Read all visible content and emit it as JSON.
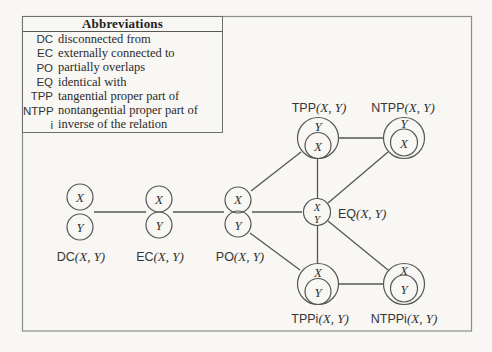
{
  "figure": {
    "background_color": "#f8f7f4",
    "stroke_color": "#565656",
    "frame_color": "#8d8d8d",
    "text_color": "#2f2f2f"
  },
  "abbreviations": {
    "title": "Abbreviations",
    "rows": [
      {
        "abbr": "DC",
        "meaning": "disconnected from"
      },
      {
        "abbr": "EC",
        "meaning": "externally connected to"
      },
      {
        "abbr": "PO",
        "meaning": "partially overlaps"
      },
      {
        "abbr": "EQ",
        "meaning": "identical with"
      },
      {
        "abbr": "TPP",
        "meaning": "tangential proper part of"
      },
      {
        "abbr": "NTPP",
        "meaning": "nontangential proper part of"
      },
      {
        "abbr": "i",
        "meaning": "inverse of the relation"
      }
    ]
  },
  "nodes": {
    "dc": {
      "rel": "DC",
      "args": "(X, Y)",
      "top": "X",
      "bottom": "Y"
    },
    "ec": {
      "rel": "EC",
      "args": "(X, Y)",
      "top": "X",
      "bottom": "Y"
    },
    "po": {
      "rel": "PO",
      "args": "(X, Y)",
      "top": "X",
      "bottom": "Y"
    },
    "eq": {
      "rel": "EQ",
      "args": "(X, Y)",
      "top": "X",
      "bottom": "Y"
    },
    "tpp": {
      "rel": "TPP",
      "args": "(X, Y)",
      "outer": "Y",
      "inner": "X"
    },
    "ntpp": {
      "rel": "NTPP",
      "args": "(X, Y)",
      "outer": "Y",
      "inner": "X"
    },
    "tppi": {
      "rel": "TPPi",
      "args": "(X, Y)",
      "outer": "X",
      "inner": "Y"
    },
    "ntppi": {
      "rel": "NTPPi",
      "args": "(X, Y)",
      "outer": "X",
      "inner": "Y"
    }
  },
  "edges": [
    {
      "from": "DC",
      "to": "EC"
    },
    {
      "from": "EC",
      "to": "PO"
    },
    {
      "from": "PO",
      "to": "TPP"
    },
    {
      "from": "PO",
      "to": "EQ"
    },
    {
      "from": "PO",
      "to": "TPPi"
    },
    {
      "from": "TPP",
      "to": "NTPP"
    },
    {
      "from": "TPP",
      "to": "EQ"
    },
    {
      "from": "EQ",
      "to": "NTPP"
    },
    {
      "from": "EQ",
      "to": "TPPi"
    },
    {
      "from": "EQ",
      "to": "NTPPi"
    },
    {
      "from": "TPPi",
      "to": "NTPPi"
    }
  ]
}
